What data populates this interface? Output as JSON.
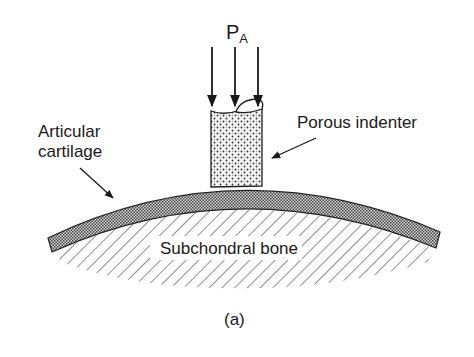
{
  "figure": {
    "load_label": "P",
    "load_subscript": "A",
    "labels": {
      "articular_cartilage_line1": "Articular",
      "articular_cartilage_line2": "cartilage",
      "porous_indenter": "Porous indenter",
      "subchondral_bone": "Subchondral bone"
    },
    "caption": "(a)"
  },
  "colors": {
    "ink": "#1a1a1a",
    "background": "#ffffff"
  }
}
